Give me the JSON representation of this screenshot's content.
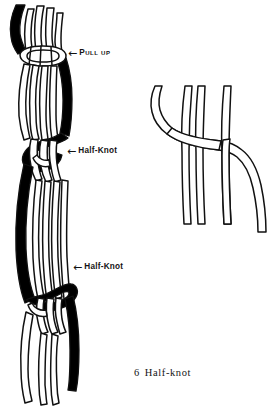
{
  "figure": {
    "name": "half-knot-macrame-diagram",
    "caption_number": "6",
    "caption_title": "Half-knot",
    "background_color": "#ffffff",
    "ink_color": "#111111",
    "cord_fill_color": "#ffffff",
    "knotting_cord_color": "#000000"
  },
  "labels": {
    "pull_up": {
      "arrow": "←",
      "text": "Pull up",
      "arrow_icon_name": "arrow-left-icon"
    },
    "half_knot_upper": {
      "arrow": "←",
      "text": "Half-Knot",
      "arrow_icon_name": "arrow-left-icon"
    },
    "half_knot_lower": {
      "arrow": "←",
      "text": "Half-Knot",
      "arrow_icon_name": "arrow-left-icon"
    }
  },
  "diagrams": {
    "left": {
      "name": "sennit-of-half-knots",
      "description": "Vertical bundle of cords bound at top, with two half-knots tied down its length and cord ends hanging free"
    },
    "right": {
      "name": "half-knot-step-detail",
      "description": "Single knotting cord bends from upper left, crosses over the filler cords, passes under the right cord and curves down"
    }
  }
}
